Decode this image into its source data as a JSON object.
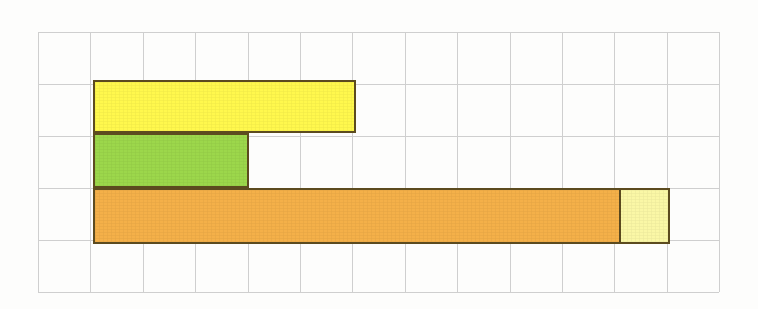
{
  "figure": {
    "background_color": "#fdfdfc",
    "grid": {
      "line_color": "#cfcfcf",
      "columns": 13,
      "rows": 5,
      "cell_width": 52.4,
      "cell_height": 52.0,
      "origin_x": 38,
      "origin_y": 32,
      "visible": true
    },
    "bar_outline_color": "#5c4b1f",
    "bar_outline_width": 2
  },
  "chart_data": {
    "type": "bar",
    "orientation": "horizontal",
    "xlabel": "",
    "ylabel": "",
    "unit": "grid cells",
    "grid": true,
    "legend": "none",
    "xlim": [
      0,
      13
    ],
    "ylim": [
      0,
      5
    ],
    "x_axis_origin_cell": 1,
    "categories": [
      "yellow-bar",
      "green-bar",
      "orange-bar"
    ],
    "values": [
      5,
      3,
      11
    ],
    "series": [
      {
        "name": "yellow-bar",
        "row": 1,
        "start_cell": 1,
        "length_cells": 5,
        "color": "#fff84d",
        "segments": [
          {
            "name": "yellow-segment",
            "length_cells": 5,
            "color": "#fff84d"
          }
        ]
      },
      {
        "name": "green-bar",
        "row": 2,
        "start_cell": 1,
        "length_cells": 3,
        "color": "#9cd74b",
        "segments": [
          {
            "name": "green-segment",
            "length_cells": 3,
            "color": "#9cd74b"
          }
        ]
      },
      {
        "name": "orange-bar",
        "row": 3,
        "start_cell": 1,
        "length_cells": 11,
        "color": "#f4b049",
        "segments": [
          {
            "name": "orange-segment",
            "length_cells": 10,
            "color": "#f4b049"
          },
          {
            "name": "pale-yellow-segment",
            "length_cells": 1,
            "color": "#faf7a6"
          }
        ]
      }
    ],
    "annotations": []
  },
  "bars": {
    "yellow": {
      "label": "yellow-bar",
      "color": "#fff84d",
      "left_px": 93,
      "top_px": 80,
      "width_px": 263,
      "height_px": 53,
      "length_cells": 5
    },
    "green": {
      "label": "green-bar",
      "color": "#9cd74b",
      "left_px": 93,
      "top_px": 133,
      "width_px": 156,
      "height_px": 55,
      "length_cells": 3
    },
    "orange": {
      "label": "orange-bar",
      "color": "#f4b049",
      "left_px": 93,
      "top_px": 188,
      "width_px": 577,
      "height_px": 56,
      "length_cells": 11,
      "segment_main_width_px": 524,
      "segment_main_color": "#f4b049",
      "segment_tail_width_px": 53,
      "segment_tail_color": "#faf7a6"
    }
  }
}
